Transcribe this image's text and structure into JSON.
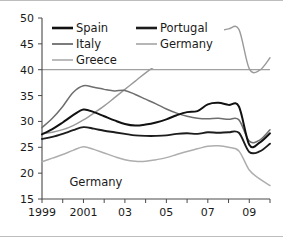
{
  "chart_data": {
    "type": "line",
    "title": "",
    "subtitle": "",
    "xlabel": "",
    "ylabel": "",
    "xlim": [
      1999,
      2010
    ],
    "ylim": [
      15,
      50
    ],
    "yticks": [
      15,
      20,
      25,
      30,
      35,
      40,
      45,
      50
    ],
    "ytick_labels": [
      "15",
      "20",
      "25",
      "30",
      "35",
      "40",
      "45",
      "50"
    ],
    "xticks": [
      1999,
      2000,
      2001,
      2002,
      2003,
      2004,
      2005,
      2006,
      2007,
      2008,
      2009,
      2010
    ],
    "xtick_labels": [
      "1999",
      "",
      "2001",
      "",
      "03",
      "",
      "05",
      "",
      "07",
      "",
      "09",
      ""
    ],
    "grid": false,
    "reference_line": {
      "value": 40,
      "color": "#8a8a8a"
    },
    "legend": {
      "position": "top-left",
      "entries": [
        "Spain",
        "Portugal",
        "Italy",
        "Germany",
        "Greece"
      ]
    },
    "annotations": [
      {
        "text": "Germany",
        "x": 2001.6,
        "y": 17.6
      }
    ],
    "x": [
      1999,
      1999.5,
      2000,
      2000.5,
      2001,
      2001.5,
      2002,
      2002.5,
      2003,
      2003.5,
      2004,
      2004.5,
      2005,
      2005.5,
      2006,
      2006.5,
      2007,
      2007.5,
      2008,
      2008.5,
      2009,
      2009.5,
      2010
    ],
    "series": [
      {
        "name": "Greece",
        "color": "#9a9a9a",
        "width": 1.4,
        "values": [
          27.6,
          27.9,
          28.4,
          29.2,
          30.3,
          31.6,
          33.0,
          34.6,
          36.2,
          37.8,
          39.4,
          40.8,
          42.2,
          44.7,
          43.6,
          44.8,
          46.2,
          47.3,
          47.9,
          47.8,
          40.2,
          39.9,
          42.3
        ]
      },
      {
        "name": "Italy",
        "color": "#6e6e6e",
        "width": 1.5,
        "values": [
          28.8,
          30.6,
          32.9,
          35.6,
          36.9,
          36.6,
          36.2,
          35.9,
          36.0,
          35.2,
          34.3,
          33.4,
          32.4,
          31.6,
          31.0,
          30.6,
          30.5,
          30.6,
          30.4,
          30.3,
          26.2,
          26.4,
          28.4
        ]
      },
      {
        "name": "Spain",
        "color": "#111111",
        "width": 2.0,
        "values": [
          27.5,
          28.5,
          29.8,
          31.2,
          32.3,
          31.8,
          31.0,
          30.2,
          29.5,
          29.2,
          29.4,
          29.8,
          30.4,
          31.2,
          31.8,
          32.0,
          33.3,
          33.6,
          33.2,
          32.9,
          25.5,
          25.9,
          27.7
        ]
      },
      {
        "name": "Portugal",
        "color": "#1c1c1c",
        "width": 1.9,
        "values": [
          26.6,
          27.0,
          27.6,
          28.3,
          28.9,
          28.6,
          28.2,
          27.9,
          27.6,
          27.3,
          27.2,
          27.2,
          27.3,
          27.6,
          27.7,
          27.6,
          27.9,
          27.8,
          27.9,
          27.8,
          24.1,
          24.2,
          25.7
        ]
      },
      {
        "name": "Germany",
        "color": "#aeaeae",
        "width": 1.5,
        "values": [
          22.2,
          22.9,
          23.6,
          24.4,
          25.1,
          24.6,
          23.9,
          23.2,
          22.6,
          22.3,
          22.3,
          22.6,
          23.0,
          23.6,
          24.2,
          24.7,
          25.2,
          25.3,
          25.0,
          24.3,
          20.6,
          18.9,
          17.6
        ]
      }
    ]
  },
  "legend_items": [
    {
      "label": "Spain",
      "color": "#111111",
      "width": 2.6
    },
    {
      "label": "Portugal",
      "color": "#1c1c1c",
      "width": 2.6
    },
    {
      "label": "Italy",
      "color": "#6e6e6e",
      "width": 1.8
    },
    {
      "label": "Germany",
      "color": "#aeaeae",
      "width": 1.8
    },
    {
      "label": "Greece",
      "color": "#b4b4b4",
      "width": 1.8
    }
  ]
}
